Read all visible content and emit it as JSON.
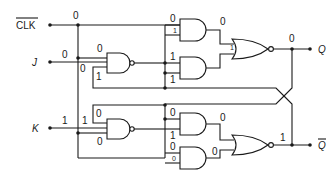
{
  "diagram": {
    "inputs": {
      "clk_bar": "CLK",
      "j": "J",
      "k": "K"
    },
    "outputs": {
      "q": "Q",
      "q_bar": "Q"
    },
    "values": {
      "clk_line": "0",
      "j_line": "0",
      "k_line": "1",
      "nand_j_in_top": "0",
      "nand_j_in_mid": "0",
      "nand_j_in_fb": "1",
      "nand_k_in_fb": "0",
      "nand_k_in_top": "1",
      "nand_k_in_bot": "0",
      "and1_in_top": "0",
      "and1_in_bot": "1",
      "and2_in_top": "1",
      "and2_in_bot": "1",
      "and1_out": "0",
      "nor_top_in": "1",
      "q_value": "0",
      "and3_in_top": "0",
      "and3_in_bot": "1",
      "and3_out": "0",
      "and4_in_top": "0",
      "and4_in_bot": "0",
      "and4_out": "0",
      "qbar_value": "1"
    },
    "gates": [
      {
        "id": "nand-j",
        "type": "NAND"
      },
      {
        "id": "nand-k",
        "type": "NAND"
      },
      {
        "id": "and-1",
        "type": "AND"
      },
      {
        "id": "and-2",
        "type": "AND"
      },
      {
        "id": "and-3",
        "type": "AND"
      },
      {
        "id": "and-4",
        "type": "AND"
      },
      {
        "id": "nor-q",
        "type": "NOR"
      },
      {
        "id": "nor-qbar",
        "type": "NOR"
      }
    ]
  }
}
